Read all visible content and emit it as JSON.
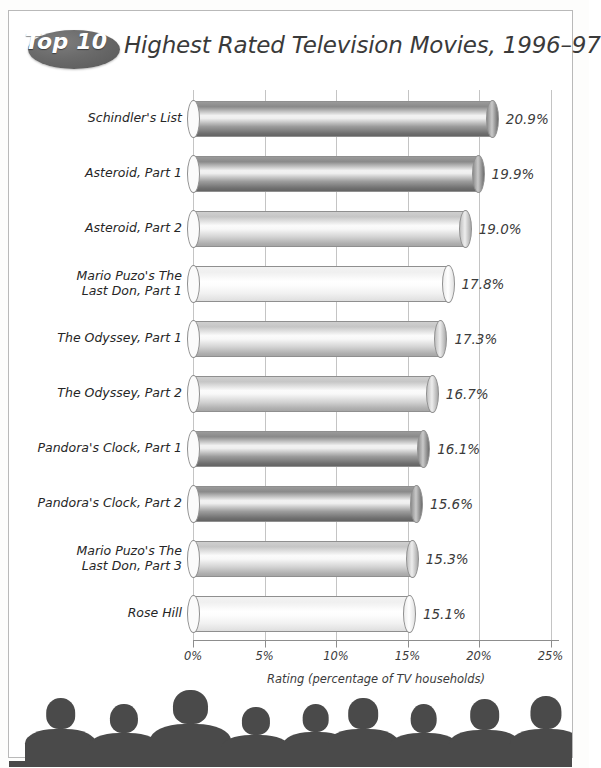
{
  "title": {
    "badge": "Top 10",
    "text": "Highest Rated Television Movies, 1996–97"
  },
  "chart_data": {
    "type": "bar",
    "orientation": "horizontal",
    "title": "Top 10 Highest Rated Television Movies, 1996–97",
    "xlabel": "Rating (percentage of TV households)",
    "ylabel": "",
    "xlim": [
      0,
      25
    ],
    "xticks": [
      "0%",
      "5%",
      "10%",
      "15%",
      "20%",
      "25%"
    ],
    "xtick_values": [
      0,
      5,
      10,
      15,
      20,
      25
    ],
    "grid": true,
    "legend": "none",
    "categories": [
      "Schindler's List",
      "Asteroid, Part 1",
      "Asteroid, Part 2",
      "Mario Puzo's The\nLast Don, Part 1",
      "The Odyssey, Part 1",
      "The Odyssey, Part 2",
      "Pandora's Clock, Part 1",
      "Pandora's Clock, Part 2",
      "Mario Puzo's The\nLast Don, Part 3",
      "Rose Hill"
    ],
    "values": [
      20.9,
      19.9,
      19.0,
      17.8,
      17.3,
      16.7,
      16.1,
      15.6,
      15.3,
      15.1
    ],
    "value_labels": [
      "20.9%",
      "19.9%",
      "19.0%",
      "17.8%",
      "17.3%",
      "16.7%",
      "16.1%",
      "15.6%",
      "15.3%",
      "15.1%"
    ],
    "bar_shades": [
      "dark",
      "dark",
      "medium",
      "light",
      "medium",
      "medium",
      "dark",
      "dark",
      "medium",
      "light"
    ]
  },
  "colors": {
    "frame": "#b9b9b9",
    "badge": "#6a6a6a",
    "badge_text": "#ffffff",
    "title_text": "#3a3a3a",
    "grid": "#c4c4c4",
    "axis": "#8d8d8d",
    "label_text": "#262626",
    "value_text": "#3b3b3b",
    "silhouette": "#4a4a4a"
  },
  "audience": {
    "count": 9,
    "label": "audience-silhouettes"
  }
}
